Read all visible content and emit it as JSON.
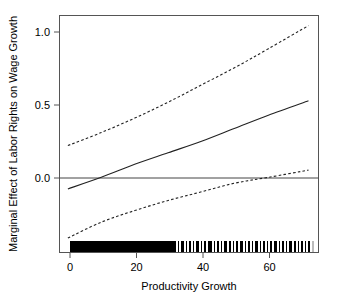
{
  "chart_data": {
    "type": "line",
    "title": "",
    "xlabel": "Productivity Growth",
    "ylabel": "Marginal Effect of Labor Rights on Wage Growth",
    "xlim": [
      -2.5,
      75.0
    ],
    "ylim": [
      -0.52,
      1.12
    ],
    "xticks": [
      0,
      20,
      40,
      60
    ],
    "xticklabels": [
      "0",
      "20",
      "40",
      "60"
    ],
    "yticks": [
      0.0,
      0.5,
      1.0
    ],
    "yticklabels": [
      "0.0",
      "0.5",
      "1.0"
    ],
    "grid": false,
    "legend": "none",
    "zero_reference_line": 0.0,
    "series": [
      {
        "name": "marginal effect",
        "style": "solid",
        "x": [
          0,
          10,
          20,
          30,
          40,
          50,
          60,
          72
        ],
        "values": [
          -0.08,
          0.0,
          0.09,
          0.17,
          0.25,
          0.34,
          0.43,
          0.53
        ]
      },
      {
        "name": "upper 95% confidence bound",
        "style": "dashed",
        "x": [
          0,
          10,
          20,
          30,
          40,
          50,
          60,
          72
        ],
        "values": [
          0.22,
          0.31,
          0.41,
          0.52,
          0.64,
          0.76,
          0.89,
          1.05
        ]
      },
      {
        "name": "lower 95% confidence bound",
        "style": "dashed",
        "x": [
          0,
          10,
          20,
          30,
          40,
          50,
          60,
          72
        ],
        "values": [
          -0.42,
          -0.31,
          -0.23,
          -0.16,
          -0.1,
          -0.04,
          0.0,
          0.05
        ]
      }
    ],
    "annotations": {
      "zero_crossing_estimate": 11,
      "zero_crossing_lower_bound": 55
    },
    "rug": {
      "description": "rug plot of observed productivity growth values along bottom axis",
      "dense_range": [
        0,
        48
      ],
      "sparse_range": [
        48,
        73
      ]
    }
  }
}
